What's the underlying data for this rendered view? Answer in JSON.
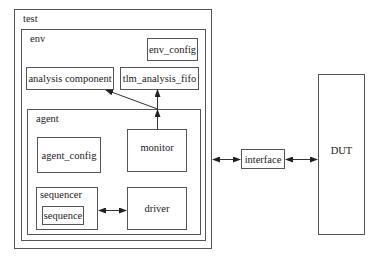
{
  "diagram": {
    "containers": {
      "test": {
        "label": "test"
      },
      "env": {
        "label": "env"
      },
      "agent": {
        "label": "agent"
      },
      "sequencer": {
        "label": "sequencer"
      }
    },
    "components": {
      "env_config": "env_config",
      "analysis_component": "analysis component",
      "tlm_analysis_fifo": "tlm_analysis_fifo",
      "agent_config": "agent_config",
      "monitor": "monitor",
      "sequence": "sequence",
      "driver": "driver",
      "interface": "interface",
      "dut": "DUT"
    },
    "connections": [
      {
        "from": "monitor",
        "to": "tlm_analysis_fifo",
        "type": "arrow"
      },
      {
        "from": "monitor",
        "to": "analysis_component",
        "type": "arrow"
      },
      {
        "from": "sequencer",
        "to": "driver",
        "type": "bidirectional"
      },
      {
        "from": "test",
        "to": "interface",
        "type": "bidirectional"
      },
      {
        "from": "interface",
        "to": "DUT",
        "type": "bidirectional"
      }
    ],
    "colors": {
      "line": "#555555",
      "background": "#ffffff"
    }
  }
}
